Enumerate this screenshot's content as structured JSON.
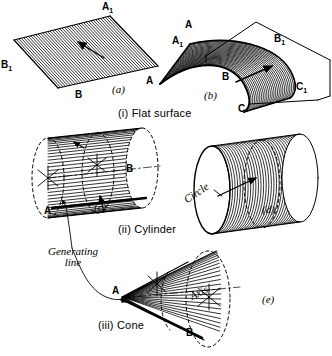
{
  "figure": {
    "background": "#ffffff",
    "ink": "#000000"
  },
  "sections": [
    {
      "id": "i",
      "caption": "(i)  Flat surface"
    },
    {
      "id": "ii",
      "caption": "(ii)  Cylinder"
    },
    {
      "id": "iii",
      "caption": "(iii) Cone"
    }
  ],
  "panels": [
    {
      "id": "a",
      "tag": "(a)",
      "kind": "flat-surface-straight-translation"
    },
    {
      "id": "b",
      "tag": "(b)",
      "kind": "warped-surface-curved-translation"
    },
    {
      "id": "c",
      "tag": "(c)",
      "kind": "cylinder-line-around-circle"
    },
    {
      "id": "d",
      "tag": "(d)",
      "kind": "cylinder-circle-along-axis"
    },
    {
      "id": "e",
      "tag": "(e)",
      "kind": "cone-line-about-apex"
    }
  ],
  "point_labels": {
    "a": [
      {
        "name": "A1",
        "text": "A",
        "sub": "1"
      },
      {
        "name": "B1",
        "text": "B",
        "sub": "1"
      },
      {
        "name": "B",
        "text": "B",
        "sub": ""
      }
    ],
    "b": [
      {
        "name": "A",
        "text": "A",
        "sub": ""
      },
      {
        "name": "A1",
        "text": "A",
        "sub": "1"
      },
      {
        "name": "B",
        "text": "B",
        "sub": ""
      },
      {
        "name": "B1",
        "text": "B",
        "sub": "1"
      },
      {
        "name": "C",
        "text": "C",
        "sub": ""
      },
      {
        "name": "C1",
        "text": "C",
        "sub": "1"
      }
    ],
    "c": [
      {
        "name": "A",
        "text": "A",
        "sub": ""
      },
      {
        "name": "B",
        "text": "B",
        "sub": ""
      }
    ],
    "e": [
      {
        "name": "A",
        "text": "A",
        "sub": ""
      },
      {
        "name": "B",
        "text": "B",
        "sub": ""
      }
    ]
  },
  "annotations": {
    "generating_line": "Generating\nline",
    "generating_line_1": "Generating",
    "generating_line_2": "line",
    "circle": "Circle",
    "axis": "Axis"
  },
  "captions": {
    "flat": "(i)  Flat surface",
    "cylinder": "(ii)  Cylinder",
    "cone": "(iii) Cone"
  },
  "panel_tags": {
    "a": "(a)",
    "b": "(b)",
    "c": "(c)",
    "d": "(d)",
    "e": "(e)"
  }
}
